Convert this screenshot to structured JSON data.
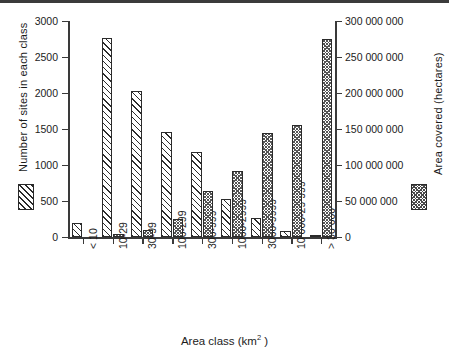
{
  "figure": {
    "xlabel_text": "Area class (km",
    "xlabel_sup": "2",
    "xlabel_tail": " )",
    "caption_partial": ""
  },
  "legend": {
    "sites_swatch": "diagonal-hatch-swatch",
    "area_swatch": "cross-hatch-swatch"
  },
  "chart_data": {
    "type": "bar",
    "title": "",
    "xlabel": "Area class (km2)",
    "categories": [
      "< 10",
      "10-29",
      "30-99",
      "100-299",
      "300-999",
      "1000-2999",
      "3000-9999",
      "10 000-29 999",
      "> 30 000"
    ],
    "series": [
      {
        "name": "Number of sites in each class",
        "axis": "left",
        "ylabel": "Number of sites in each class",
        "ylim": [
          0,
          3000
        ],
        "yticks": [
          0,
          500,
          1000,
          1500,
          2000,
          2500,
          3000
        ],
        "ytick_labels": [
          "0",
          "500",
          "1000",
          "1500",
          "2000",
          "2500",
          "3000"
        ],
        "values": [
          195,
          2765,
          2030,
          1465,
          1175,
          530,
          265,
          80,
          15
        ],
        "pattern": "diagonal-hatch"
      },
      {
        "name": "Area covered (hectares)",
        "axis": "right",
        "ylabel": "Area covered (hectares)",
        "ylim": [
          0,
          300000000
        ],
        "yticks": [
          0,
          50000000,
          100000000,
          150000000,
          200000000,
          250000000,
          300000000
        ],
        "ytick_labels": [
          "0",
          "50 000 000",
          "100 000 000",
          "150 000 000",
          "200 000 000",
          "250 000 000",
          "300 000 000"
        ],
        "values": [
          0,
          4000000,
          10000000,
          25000000,
          64000000,
          92000000,
          145000000,
          156000000,
          275000000
        ],
        "pattern": "cross-hatch"
      }
    ],
    "grid": false,
    "legend_position": "outside-left-and-right"
  }
}
